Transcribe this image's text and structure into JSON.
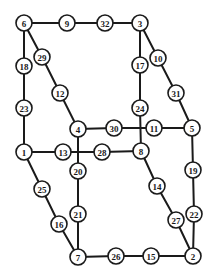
{
  "diagram": {
    "type": "graph",
    "colors": {
      "line": "#1a1a1a",
      "node_fill": "#ffffff",
      "background": "#ffffff"
    },
    "node_radius": 8,
    "nodes": [
      {
        "id": "6",
        "label": "6",
        "x": 24,
        "y": 23
      },
      {
        "id": "9",
        "label": "9",
        "x": 67,
        "y": 23
      },
      {
        "id": "32",
        "label": "32",
        "x": 105,
        "y": 23
      },
      {
        "id": "3",
        "label": "3",
        "x": 140,
        "y": 23
      },
      {
        "id": "29",
        "label": "29",
        "x": 42,
        "y": 57
      },
      {
        "id": "18",
        "label": "18",
        "x": 24,
        "y": 66
      },
      {
        "id": "10",
        "label": "10",
        "x": 158,
        "y": 58
      },
      {
        "id": "17",
        "label": "17",
        "x": 140,
        "y": 65
      },
      {
        "id": "12",
        "label": "12",
        "x": 60,
        "y": 93
      },
      {
        "id": "31",
        "label": "31",
        "x": 176,
        "y": 93
      },
      {
        "id": "23",
        "label": "23",
        "x": 24,
        "y": 108
      },
      {
        "id": "24",
        "label": "24",
        "x": 140,
        "y": 108
      },
      {
        "id": "4",
        "label": "4",
        "x": 78,
        "y": 129
      },
      {
        "id": "30",
        "label": "30",
        "x": 114,
        "y": 128
      },
      {
        "id": "11",
        "label": "11",
        "x": 154,
        "y": 128
      },
      {
        "id": "5",
        "label": "5",
        "x": 192,
        "y": 128
      },
      {
        "id": "1",
        "label": "1",
        "x": 24,
        "y": 152
      },
      {
        "id": "13",
        "label": "13",
        "x": 63,
        "y": 152
      },
      {
        "id": "28",
        "label": "28",
        "x": 102,
        "y": 152
      },
      {
        "id": "8",
        "label": "8",
        "x": 141,
        "y": 151
      },
      {
        "id": "20",
        "label": "20",
        "x": 78,
        "y": 171
      },
      {
        "id": "19",
        "label": "19",
        "x": 193,
        "y": 170
      },
      {
        "id": "25",
        "label": "25",
        "x": 42,
        "y": 189
      },
      {
        "id": "14",
        "label": "14",
        "x": 157,
        "y": 186
      },
      {
        "id": "21",
        "label": "21",
        "x": 78,
        "y": 214
      },
      {
        "id": "22",
        "label": "22",
        "x": 194,
        "y": 214
      },
      {
        "id": "16",
        "label": "16",
        "x": 59,
        "y": 224
      },
      {
        "id": "27",
        "label": "27",
        "x": 176,
        "y": 220
      },
      {
        "id": "7",
        "label": "7",
        "x": 78,
        "y": 257
      },
      {
        "id": "26",
        "label": "26",
        "x": 116,
        "y": 256
      },
      {
        "id": "15",
        "label": "15",
        "x": 151,
        "y": 256
      },
      {
        "id": "2",
        "label": "2",
        "x": 193,
        "y": 256
      }
    ],
    "edges": [
      [
        "6",
        "9"
      ],
      [
        "9",
        "32"
      ],
      [
        "32",
        "3"
      ],
      [
        "6",
        "18"
      ],
      [
        "18",
        "23"
      ],
      [
        "23",
        "1"
      ],
      [
        "6",
        "29"
      ],
      [
        "29",
        "12"
      ],
      [
        "12",
        "4"
      ],
      [
        "3",
        "17"
      ],
      [
        "17",
        "24"
      ],
      [
        "24",
        "8"
      ],
      [
        "3",
        "10"
      ],
      [
        "10",
        "31"
      ],
      [
        "31",
        "5"
      ],
      [
        "4",
        "30"
      ],
      [
        "30",
        "11"
      ],
      [
        "11",
        "5"
      ],
      [
        "1",
        "13"
      ],
      [
        "13",
        "28"
      ],
      [
        "28",
        "8"
      ],
      [
        "4",
        "20"
      ],
      [
        "20",
        "21"
      ],
      [
        "21",
        "7"
      ],
      [
        "1",
        "25"
      ],
      [
        "25",
        "16"
      ],
      [
        "16",
        "7"
      ],
      [
        "5",
        "19"
      ],
      [
        "19",
        "22"
      ],
      [
        "22",
        "2"
      ],
      [
        "8",
        "14"
      ],
      [
        "14",
        "27"
      ],
      [
        "27",
        "2"
      ],
      [
        "7",
        "26"
      ],
      [
        "26",
        "15"
      ],
      [
        "15",
        "2"
      ]
    ]
  }
}
